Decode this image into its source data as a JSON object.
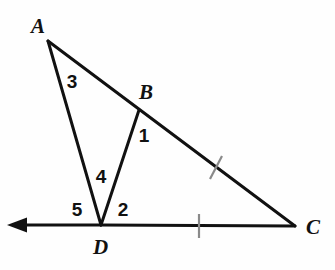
{
  "figure": {
    "background_color": "#fefefe",
    "stroke_color": "#111111",
    "tick_color": "#8a8a8a",
    "stroke_width": 3
  },
  "vertices": [
    {
      "id": "A",
      "label": "A",
      "x": 48,
      "y": 41,
      "label_x": 31,
      "label_y": 33
    },
    {
      "id": "B",
      "label": "B",
      "x": 139,
      "y": 110,
      "label_x": 139,
      "label_y": 99
    },
    {
      "id": "C",
      "label": "C",
      "x": 295,
      "y": 226,
      "label_x": 306,
      "label_y": 234
    },
    {
      "id": "D",
      "label": "D",
      "x": 101,
      "y": 225,
      "label_x": 93,
      "label_y": 254
    }
  ],
  "segments": [
    {
      "name": "segment-AC",
      "from": "A",
      "to": "C",
      "x1": 48,
      "y1": 41,
      "x2": 295,
      "y2": 226
    },
    {
      "name": "segment-AD",
      "from": "A",
      "to": "D",
      "x1": 48,
      "y1": 41,
      "x2": 101,
      "y2": 225
    },
    {
      "name": "segment-BD",
      "from": "B",
      "to": "D",
      "x1": 139,
      "y1": 110,
      "x2": 101,
      "y2": 225
    },
    {
      "name": "segment-DC",
      "from": "D",
      "to": "C",
      "x1": 101,
      "y1": 225,
      "x2": 295,
      "y2": 226
    }
  ],
  "ray": {
    "name": "ray-D-left",
    "from": "D",
    "x1": 101,
    "y1": 225,
    "x2": 18,
    "y2": 225,
    "arrow_tip_x": 7,
    "arrow_tip_y": 225,
    "direction": "left"
  },
  "tick_marks": [
    {
      "name": "tick-segment-BC",
      "on_segment": "BC",
      "count": 1,
      "x1": 222,
      "y1": 156,
      "x2": 210,
      "y2": 179
    },
    {
      "name": "tick-segment-DC",
      "on_segment": "DC",
      "count": 1,
      "x1": 199,
      "y1": 214,
      "x2": 199,
      "y2": 238
    }
  ],
  "angle_labels": [
    {
      "id": "1",
      "label": "1",
      "x": 144,
      "y": 142,
      "at_vertex": "B"
    },
    {
      "id": "2",
      "label": "2",
      "x": 123,
      "y": 216,
      "at_vertex": "D"
    },
    {
      "id": "3",
      "label": "3",
      "x": 72,
      "y": 88,
      "at_vertex": "A"
    },
    {
      "id": "4",
      "label": "4",
      "x": 101,
      "y": 183,
      "at_vertex": "D"
    },
    {
      "id": "5",
      "label": "5",
      "x": 77,
      "y": 216,
      "at_vertex": "D"
    }
  ]
}
